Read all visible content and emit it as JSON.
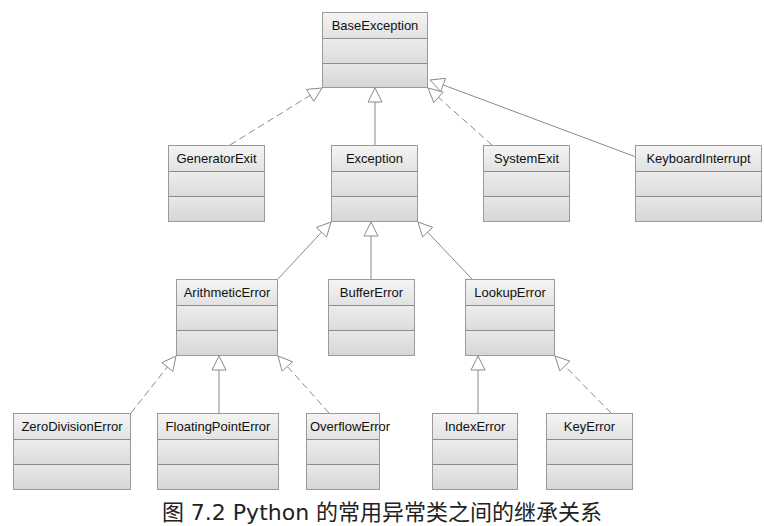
{
  "diagram": {
    "type": "uml-class-inheritance",
    "classes": [
      {
        "id": "BaseException",
        "name": "BaseException",
        "x": 322,
        "y": 12,
        "w": 106,
        "h": 76
      },
      {
        "id": "GeneratorExit",
        "name": "GeneratorExit",
        "x": 168,
        "y": 145,
        "w": 97,
        "h": 77
      },
      {
        "id": "Exception",
        "name": "Exception",
        "x": 331,
        "y": 145,
        "w": 87,
        "h": 77
      },
      {
        "id": "SystemExit",
        "name": "SystemExit",
        "x": 483,
        "y": 145,
        "w": 87,
        "h": 77
      },
      {
        "id": "KeyboardInterrupt",
        "name": "KeyboardInterrupt",
        "x": 635,
        "y": 145,
        "w": 127,
        "h": 77
      },
      {
        "id": "ArithmeticError",
        "name": "ArithmeticError",
        "x": 176,
        "y": 279,
        "w": 102,
        "h": 77
      },
      {
        "id": "BufferError",
        "name": "BufferError",
        "x": 328,
        "y": 279,
        "w": 87,
        "h": 77
      },
      {
        "id": "LookupError",
        "name": "LookupError",
        "x": 465,
        "y": 279,
        "w": 90,
        "h": 77
      },
      {
        "id": "ZeroDivisionError",
        "name": "ZeroDivisionError",
        "x": 13,
        "y": 413,
        "w": 118,
        "h": 77
      },
      {
        "id": "FloatingPointError",
        "name": "FloatingPointError",
        "x": 157,
        "y": 413,
        "w": 122,
        "h": 77
      },
      {
        "id": "OverflowError",
        "name": "OverflowError",
        "x": 306,
        "y": 413,
        "w": 74,
        "h": 77
      },
      {
        "id": "IndexError",
        "name": "IndexError",
        "x": 432,
        "y": 413,
        "w": 86,
        "h": 77
      },
      {
        "id": "KeyError",
        "name": "KeyError",
        "x": 546,
        "y": 413,
        "w": 87,
        "h": 77
      }
    ],
    "edges": [
      {
        "child": "GeneratorExit",
        "parent": "BaseException",
        "style": "dashed",
        "from": [
          230,
          145
        ],
        "to": [
          322,
          88
        ]
      },
      {
        "child": "Exception",
        "parent": "BaseException",
        "style": "solid",
        "from": [
          375,
          145
        ],
        "to": [
          375,
          88
        ]
      },
      {
        "child": "SystemExit",
        "parent": "BaseException",
        "style": "dashed",
        "from": [
          492,
          145
        ],
        "to": [
          428,
          88
        ]
      },
      {
        "child": "KeyboardInterrupt",
        "parent": "BaseException",
        "style": "solid",
        "from": [
          636,
          157
        ],
        "to": [
          430,
          80
        ]
      },
      {
        "child": "ArithmeticError",
        "parent": "Exception",
        "style": "solid",
        "from": [
          278,
          279
        ],
        "to": [
          331,
          222
        ]
      },
      {
        "child": "BufferError",
        "parent": "Exception",
        "style": "solid",
        "from": [
          371,
          279
        ],
        "to": [
          371,
          222
        ]
      },
      {
        "child": "LookupError",
        "parent": "Exception",
        "style": "solid",
        "from": [
          472,
          279
        ],
        "to": [
          418,
          222
        ]
      },
      {
        "child": "ZeroDivisionError",
        "parent": "ArithmeticError",
        "style": "dashed",
        "from": [
          131,
          413
        ],
        "to": [
          176,
          356
        ]
      },
      {
        "child": "FloatingPointError",
        "parent": "ArithmeticError",
        "style": "solid",
        "from": [
          219,
          413
        ],
        "to": [
          219,
          356
        ]
      },
      {
        "child": "OverflowError",
        "parent": "ArithmeticError",
        "style": "dashed",
        "from": [
          329,
          413
        ],
        "to": [
          278,
          356
        ]
      },
      {
        "child": "IndexError",
        "parent": "LookupError",
        "style": "solid",
        "from": [
          478,
          413
        ],
        "to": [
          478,
          356
        ]
      },
      {
        "child": "KeyError",
        "parent": "LookupError",
        "style": "dashed",
        "from": [
          611,
          413
        ],
        "to": [
          555,
          356
        ]
      }
    ],
    "colors": {
      "box_border": "#9a9a9a",
      "box_fill": "#e6e6e6",
      "edge": "#8a8a8a",
      "text": "#111111"
    }
  },
  "caption": "图 7.2   Python 的常用异常类之间的继承关系"
}
